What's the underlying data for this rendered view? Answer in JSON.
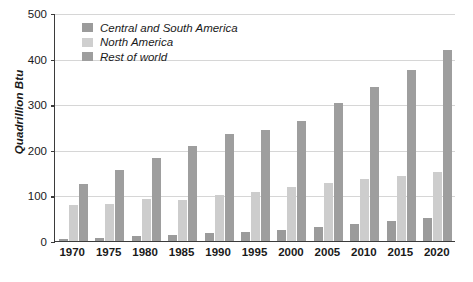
{
  "chart_data": {
    "type": "bar",
    "title": "",
    "subtitle": "",
    "xlabel": "",
    "ylabel": "Quadrillion Btu",
    "categories": [
      "1970",
      "1975",
      "1980",
      "1985",
      "1990",
      "1995",
      "2000",
      "2005",
      "2010",
      "2015",
      "2020"
    ],
    "ylim": [
      0,
      500
    ],
    "yticks": [
      0,
      100,
      200,
      300,
      400,
      500
    ],
    "ytick_labels": [
      "0",
      "100",
      "200",
      "300",
      "400",
      "500"
    ],
    "grid": "horizontal",
    "legend_position": "top-left",
    "series": [
      {
        "name": "Central and South America",
        "color": "#9b9b9b",
        "values": [
          5,
          7,
          12,
          13,
          17,
          20,
          24,
          30,
          37,
          44,
          50
        ]
      },
      {
        "name": "North America",
        "color": "#cdcdcd",
        "values": [
          78,
          82,
          92,
          89,
          101,
          108,
          118,
          128,
          137,
          143,
          152
        ]
      },
      {
        "name": "Rest of world",
        "color": "#9e9e9e",
        "values": [
          125,
          155,
          183,
          208,
          235,
          244,
          263,
          302,
          337,
          375,
          418
        ]
      }
    ]
  },
  "axis": {
    "y_title": "Quadrillion Btu"
  }
}
